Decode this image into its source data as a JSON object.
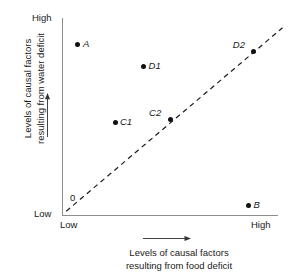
{
  "figure": {
    "cropped_header": "",
    "origin_label": "0"
  },
  "chart_data": {
    "type": "scatter",
    "title": "",
    "xlabel": "Levels of causal factors resulting from food deficit",
    "xlabel_lines": [
      "Levels of causal factors",
      "resulting from food deficit"
    ],
    "ylabel": "Levels of causal factors resulting from water deficit",
    "ylabel_lines": [
      "Levels of causal factors",
      "resulting from water deficit"
    ],
    "xticks": [
      "Low",
      "High"
    ],
    "yticks": [
      "Low",
      "High"
    ],
    "xlim": [
      0,
      1
    ],
    "ylim": [
      0,
      1
    ],
    "grid": false,
    "legend": null,
    "points": [
      {
        "label": "A",
        "x": 0.075,
        "y": 0.895,
        "label_pos": "right"
      },
      {
        "label": "D1",
        "x": 0.385,
        "y": 0.78,
        "label_pos": "right"
      },
      {
        "label": "D2",
        "x": 0.905,
        "y": 0.855,
        "label_pos": "above-left"
      },
      {
        "label": "C1",
        "x": 0.25,
        "y": 0.485,
        "label_pos": "right"
      },
      {
        "label": "C2",
        "x": 0.51,
        "y": 0.5,
        "label_pos": "above-left"
      },
      {
        "label": "B",
        "x": 0.88,
        "y": 0.05,
        "label_pos": "right"
      }
    ],
    "reference_line": {
      "style": "dashed",
      "from": [
        0.02,
        0.02
      ],
      "to": [
        1.04,
        0.98
      ],
      "note": "identity / equal-levels diagonal"
    }
  }
}
